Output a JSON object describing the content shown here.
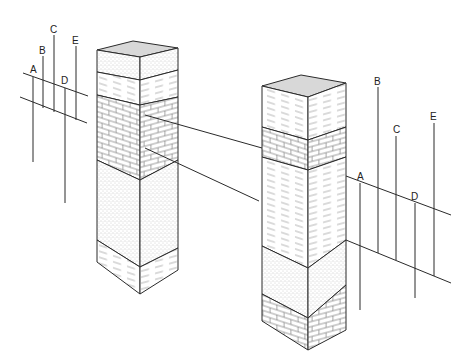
{
  "diagram": {
    "type": "stratigraphic-correlation",
    "colors": {
      "line": "#2a2a2a",
      "top_face": "#d8d8d8",
      "background": "#ffffff"
    },
    "columns": [
      {
        "name": "left-column",
        "layers_top_to_bottom": [
          "sandstone",
          "shale",
          "limestone",
          "sandstone",
          "shale"
        ]
      },
      {
        "name": "right-column",
        "layers_top_to_bottom": [
          "shale",
          "limestone",
          "shale",
          "sandstone",
          "limestone"
        ]
      }
    ],
    "correlation_lines": 2,
    "left_well_group": {
      "labels": [
        "A",
        "B",
        "C",
        "D",
        "E"
      ]
    },
    "right_well_group": {
      "labels": [
        "A",
        "B",
        "C",
        "D",
        "E"
      ]
    }
  }
}
